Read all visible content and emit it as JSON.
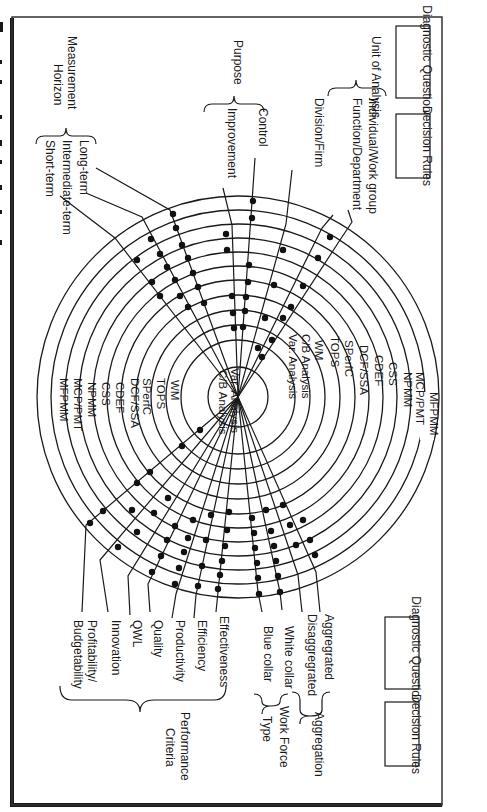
{
  "figure": {
    "caption_fragment": "F",
    "orientation": "rotated 90 degrees clockwise"
  },
  "legend_boxes": {
    "top": {
      "diagnostic_questions": "Diagnostic Questions",
      "decision_rules": "Decision Rules"
    },
    "bottom": {
      "diagnostic_questions": "Diagnostic Questions",
      "decision_rules": "Decision Rules"
    }
  },
  "dimensions": {
    "purpose": {
      "title": "Purpose",
      "options": [
        "Control",
        "Improvement"
      ]
    },
    "unit_of_analysis": {
      "title": "Unit of Analysis",
      "options": [
        "Individual/Work group",
        "Function/Department",
        "Division/Firm"
      ]
    },
    "measurement_horizon": {
      "title": "Measurement Horizon",
      "options": [
        "Long-term",
        "Intermediate-term",
        "Short-term"
      ]
    },
    "aggregation": {
      "title": "Aggregation",
      "options": [
        "Aggregrated",
        "Disaggregrated"
      ]
    },
    "work_force_type": {
      "title": "Work Force Type",
      "options": [
        "White collar",
        "Blue collar"
      ]
    },
    "performance_criteria": {
      "title": "Performance Criteria",
      "options": [
        "Effectiveness",
        "Efficiency",
        "Productivity",
        "Quality",
        "QWL",
        "Innovation",
        "Profitability/ Budgetability"
      ]
    }
  },
  "rings": {
    "outer_to_inner": [
      "MFPMM",
      "MCP/PMT",
      "NPMM",
      "CSS",
      "CDEF",
      "DCF/SSA",
      "SPerfC",
      "TOPS",
      "WM",
      "C/B Analysis",
      "Var. Analysis"
    ]
  },
  "colors": {
    "ink": "#1a1a1a",
    "background": "#ffffff"
  }
}
